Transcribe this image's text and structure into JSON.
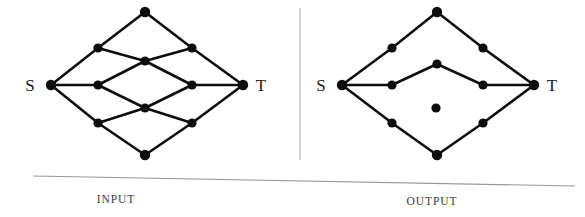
{
  "figure": {
    "background_color": "#ffffff",
    "ink_color": "#0d0d0d",
    "rule_color": "#a8a8a8",
    "panels": [
      {
        "id": "input",
        "caption": "INPUT",
        "caption_x": 116,
        "caption_y": 203,
        "source_label": "S",
        "source_label_x": 30,
        "source_label_y": 91,
        "sink_label": "T",
        "sink_label_x": 261,
        "sink_label_y": 91,
        "nodes": [
          {
            "id": "S",
            "x": 51,
            "y": 85,
            "r": 5.2,
            "label": "S"
          },
          {
            "id": "a1",
            "x": 98,
            "y": 48,
            "r": 4.6,
            "label": ""
          },
          {
            "id": "a2",
            "x": 98,
            "y": 85,
            "r": 4.6,
            "label": ""
          },
          {
            "id": "a3",
            "x": 98,
            "y": 123,
            "r": 4.6,
            "label": ""
          },
          {
            "id": "m0",
            "x": 145,
            "y": 12,
            "r": 5.2,
            "label": ""
          },
          {
            "id": "m1",
            "x": 145,
            "y": 61,
            "r": 4.6,
            "label": ""
          },
          {
            "id": "m2",
            "x": 145,
            "y": 108,
            "r": 4.6,
            "label": ""
          },
          {
            "id": "m3",
            "x": 145,
            "y": 155,
            "r": 5.2,
            "label": ""
          },
          {
            "id": "b1",
            "x": 192,
            "y": 48,
            "r": 4.6,
            "label": ""
          },
          {
            "id": "b2",
            "x": 192,
            "y": 85,
            "r": 4.6,
            "label": ""
          },
          {
            "id": "b3",
            "x": 192,
            "y": 123,
            "r": 4.6,
            "label": ""
          },
          {
            "id": "T",
            "x": 243,
            "y": 85,
            "r": 5.2,
            "label": "T"
          }
        ],
        "edges": [
          [
            "S",
            "a1"
          ],
          [
            "S",
            "a2"
          ],
          [
            "S",
            "a3"
          ],
          [
            "a1",
            "m0"
          ],
          [
            "a1",
            "m1"
          ],
          [
            "a2",
            "m1"
          ],
          [
            "a2",
            "m2"
          ],
          [
            "a3",
            "m2"
          ],
          [
            "a3",
            "m3"
          ],
          [
            "m0",
            "b1"
          ],
          [
            "m1",
            "b1"
          ],
          [
            "m1",
            "b2"
          ],
          [
            "m2",
            "b2"
          ],
          [
            "m2",
            "b3"
          ],
          [
            "m3",
            "b3"
          ],
          [
            "b1",
            "T"
          ],
          [
            "b2",
            "T"
          ],
          [
            "b3",
            "T"
          ]
        ],
        "node_count": 12,
        "edge_count": 18
      },
      {
        "id": "output",
        "caption": "OUTPUT",
        "caption_x": 432,
        "caption_y": 205,
        "source_label": "S",
        "source_label_x": 321,
        "source_label_y": 91,
        "sink_label": "T",
        "sink_label_x": 552,
        "sink_label_y": 91,
        "nodes": [
          {
            "id": "S",
            "x": 342,
            "y": 85,
            "r": 5.2,
            "label": "S"
          },
          {
            "id": "a1",
            "x": 392,
            "y": 48,
            "r": 4.6,
            "label": ""
          },
          {
            "id": "a2",
            "x": 392,
            "y": 85,
            "r": 4.6,
            "label": ""
          },
          {
            "id": "a3",
            "x": 392,
            "y": 123,
            "r": 4.6,
            "label": ""
          },
          {
            "id": "m0",
            "x": 437,
            "y": 12,
            "r": 5.2,
            "label": ""
          },
          {
            "id": "m1",
            "x": 437,
            "y": 64,
            "r": 4.6,
            "label": ""
          },
          {
            "id": "m2",
            "x": 436,
            "y": 108,
            "r": 4.6,
            "label": ""
          },
          {
            "id": "m3",
            "x": 437,
            "y": 155,
            "r": 5.2,
            "label": ""
          },
          {
            "id": "b1",
            "x": 483,
            "y": 48,
            "r": 4.6,
            "label": ""
          },
          {
            "id": "b2",
            "x": 483,
            "y": 85,
            "r": 4.6,
            "label": ""
          },
          {
            "id": "b3",
            "x": 483,
            "y": 123,
            "r": 4.6,
            "label": ""
          },
          {
            "id": "T",
            "x": 534,
            "y": 85,
            "r": 5.2,
            "label": "T"
          }
        ],
        "edges": [
          [
            "S",
            "a1"
          ],
          [
            "S",
            "a2"
          ],
          [
            "S",
            "a3"
          ],
          [
            "a1",
            "m0"
          ],
          [
            "m0",
            "b1"
          ],
          [
            "b1",
            "T"
          ],
          [
            "a2",
            "m1"
          ],
          [
            "m1",
            "b2"
          ],
          [
            "b2",
            "T"
          ],
          [
            "a3",
            "m3"
          ],
          [
            "m3",
            "b3"
          ],
          [
            "b3",
            "T"
          ]
        ],
        "isolated_nodes": [
          "m2"
        ],
        "node_count": 12,
        "edge_count": 12,
        "disjoint_paths": 3
      }
    ],
    "divider": {
      "x1": 300,
      "y1": 8,
      "x2": 300,
      "y2": 160
    },
    "baseline": {
      "x1": 33,
      "y1": 176,
      "x2": 575,
      "y2": 186
    }
  }
}
